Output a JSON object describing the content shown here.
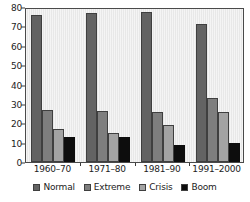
{
  "chart_data": {
    "type": "bar",
    "title": "",
    "subtitle": "",
    "xlabel": "",
    "ylabel": "",
    "categories": [
      "1960–70",
      "1971–80",
      "1981–90",
      "1991–2000"
    ],
    "series": [
      {
        "name": "Normal",
        "color": "#636363",
        "values": [
          76,
          77,
          77.5,
          71
        ]
      },
      {
        "name": "Extreme",
        "color": "#7e7e7e",
        "values": [
          27,
          26.5,
          26,
          33
        ]
      },
      {
        "name": "Crisis",
        "color": "#a3a3a3",
        "values": [
          17,
          15,
          19,
          26
        ]
      },
      {
        "name": "Boom",
        "color": "#0d0d0d",
        "values": [
          13,
          13,
          9,
          10
        ]
      }
    ],
    "ylim": [
      0,
      80
    ],
    "yticks": [
      0,
      10,
      20,
      30,
      40,
      50,
      60,
      70,
      80
    ],
    "ytick_labels": [
      "0",
      "10",
      "20",
      "30",
      "40",
      "50",
      "60",
      "70",
      "80"
    ],
    "grid": false,
    "legend_position": "bottom",
    "plot_background": "#e8e8e8",
    "axis_color": "#4a4a4a"
  },
  "legend": {
    "items": [
      {
        "label": "Normal"
      },
      {
        "label": "Extreme"
      },
      {
        "label": "Crisis"
      },
      {
        "label": "Boom"
      }
    ]
  }
}
